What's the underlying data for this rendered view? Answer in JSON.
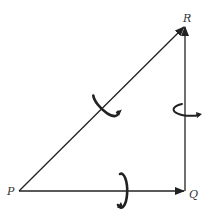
{
  "diagram": {
    "type": "vector-triangle",
    "points": {
      "P": {
        "label": "P",
        "x": 19,
        "y": 191
      },
      "Q": {
        "label": "Q",
        "x": 185,
        "y": 191
      },
      "R": {
        "label": "R",
        "x": 185,
        "y": 26
      }
    },
    "vectors": [
      {
        "from": "P",
        "to": "Q",
        "rotation_curl": true
      },
      {
        "from": "Q",
        "to": "R",
        "rotation_curl": true
      },
      {
        "from": "P",
        "to": "R",
        "rotation_curl": true
      }
    ],
    "colors": {
      "line": "#222222",
      "label": "#333333",
      "background": "#ffffff"
    }
  }
}
